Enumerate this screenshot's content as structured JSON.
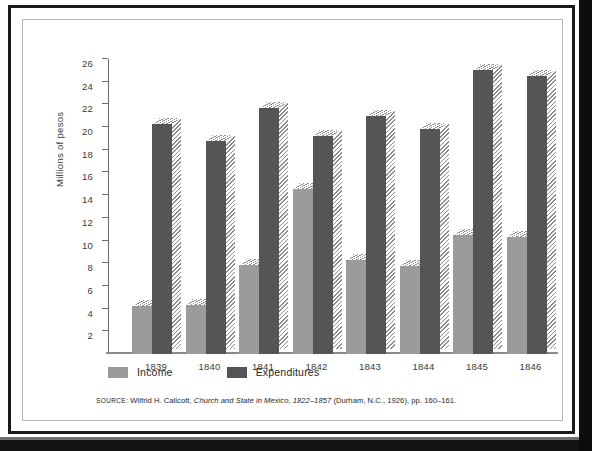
{
  "figure": {
    "axis_title": "Millions of pesos",
    "source_prefix": "SOURCE:",
    "source_author": "Wilfrid H. Callcott,",
    "source_title": "Church and State in Mexico, 1822–1857",
    "source_tail": "(Durham, N.C., 1926), pp. 160–161."
  },
  "legend": {
    "items": [
      {
        "label": "Income",
        "color": "#9b9b9b",
        "key": "income"
      },
      {
        "label": "Expenditures",
        "color": "#555555",
        "key": "expenditures"
      }
    ]
  },
  "chart_data": {
    "type": "bar",
    "title": "",
    "xlabel": "",
    "ylabel": "Millions of pesos",
    "ylim": [
      0,
      26
    ],
    "yticks": [
      2,
      4,
      6,
      8,
      10,
      12,
      14,
      16,
      18,
      20,
      22,
      24,
      26
    ],
    "grid": false,
    "legend_position": "below-axis-left",
    "categories": [
      "1839",
      "1840",
      "1841",
      "1842",
      "1843",
      "1844",
      "1845",
      "1846"
    ],
    "series": [
      {
        "name": "Income",
        "color": "#9b9b9b",
        "values": [
          4.2,
          4.3,
          7.85,
          14.5,
          8.25,
          7.8,
          10.5,
          10.3
        ]
      },
      {
        "name": "Expenditures",
        "color": "#555555",
        "values": [
          20.3,
          18.8,
          21.7,
          19.2,
          21.0,
          19.8,
          25.0,
          24.5
        ]
      }
    ],
    "annotations": [],
    "source_note": "SOURCE: Wilfrid H. Callcott, Church and State in Mexico, 1822–1857 (Durham, N.C., 1926), pp. 160–161."
  }
}
